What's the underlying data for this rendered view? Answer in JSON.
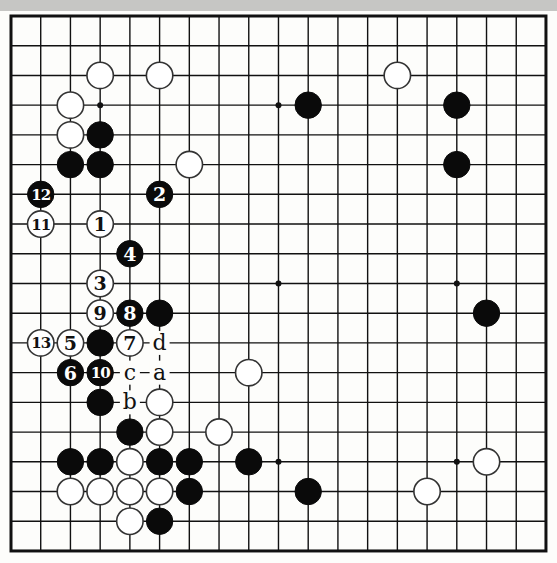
{
  "diagram": {
    "type": "go-board-diagram",
    "board_size": 19,
    "colors": {
      "background": "#fdfdfb",
      "band": "#c6c6c4",
      "line": "#111111",
      "black": "#0a0a0a",
      "white": "#ffffff"
    },
    "star_points": [
      [
        3,
        3
      ],
      [
        9,
        3
      ],
      [
        15,
        3
      ],
      [
        3,
        9
      ],
      [
        9,
        9
      ],
      [
        15,
        9
      ],
      [
        3,
        15
      ],
      [
        9,
        15
      ],
      [
        15,
        15
      ]
    ],
    "stones": [
      {
        "c": "W",
        "x": 3,
        "y": 2
      },
      {
        "c": "W",
        "x": 5,
        "y": 2
      },
      {
        "c": "W",
        "x": 13,
        "y": 2
      },
      {
        "c": "W",
        "x": 2,
        "y": 3
      },
      {
        "c": "B",
        "x": 10,
        "y": 3
      },
      {
        "c": "B",
        "x": 15,
        "y": 3
      },
      {
        "c": "W",
        "x": 2,
        "y": 4
      },
      {
        "c": "B",
        "x": 3,
        "y": 4
      },
      {
        "c": "B",
        "x": 2,
        "y": 5
      },
      {
        "c": "B",
        "x": 3,
        "y": 5
      },
      {
        "c": "W",
        "x": 6,
        "y": 5
      },
      {
        "c": "B",
        "x": 15,
        "y": 5
      },
      {
        "c": "B",
        "x": 1,
        "y": 6,
        "n": "12"
      },
      {
        "c": "B",
        "x": 5,
        "y": 6,
        "n": "2"
      },
      {
        "c": "W",
        "x": 1,
        "y": 7,
        "n": "11"
      },
      {
        "c": "W",
        "x": 3,
        "y": 7,
        "n": "1"
      },
      {
        "c": "B",
        "x": 4,
        "y": 8,
        "n": "4"
      },
      {
        "c": "W",
        "x": 3,
        "y": 9,
        "n": "3"
      },
      {
        "c": "W",
        "x": 3,
        "y": 10,
        "n": "9"
      },
      {
        "c": "B",
        "x": 4,
        "y": 10,
        "n": "8"
      },
      {
        "c": "B",
        "x": 5,
        "y": 10
      },
      {
        "c": "B",
        "x": 16,
        "y": 10
      },
      {
        "c": "W",
        "x": 1,
        "y": 11,
        "n": "13"
      },
      {
        "c": "W",
        "x": 2,
        "y": 11,
        "n": "5"
      },
      {
        "c": "B",
        "x": 3,
        "y": 11
      },
      {
        "c": "W",
        "x": 4,
        "y": 11,
        "n": "7"
      },
      {
        "c": "B",
        "x": 2,
        "y": 12,
        "n": "6"
      },
      {
        "c": "B",
        "x": 3,
        "y": 12,
        "n": "10"
      },
      {
        "c": "W",
        "x": 8,
        "y": 12
      },
      {
        "c": "B",
        "x": 3,
        "y": 13
      },
      {
        "c": "W",
        "x": 5,
        "y": 13
      },
      {
        "c": "B",
        "x": 4,
        "y": 14
      },
      {
        "c": "W",
        "x": 5,
        "y": 14
      },
      {
        "c": "W",
        "x": 7,
        "y": 14
      },
      {
        "c": "B",
        "x": 2,
        "y": 15
      },
      {
        "c": "B",
        "x": 3,
        "y": 15
      },
      {
        "c": "W",
        "x": 4,
        "y": 15
      },
      {
        "c": "B",
        "x": 5,
        "y": 15
      },
      {
        "c": "B",
        "x": 6,
        "y": 15
      },
      {
        "c": "B",
        "x": 8,
        "y": 15
      },
      {
        "c": "W",
        "x": 16,
        "y": 15
      },
      {
        "c": "W",
        "x": 2,
        "y": 16
      },
      {
        "c": "W",
        "x": 3,
        "y": 16
      },
      {
        "c": "W",
        "x": 4,
        "y": 16
      },
      {
        "c": "W",
        "x": 5,
        "y": 16
      },
      {
        "c": "B",
        "x": 6,
        "y": 16
      },
      {
        "c": "B",
        "x": 10,
        "y": 16
      },
      {
        "c": "W",
        "x": 14,
        "y": 16
      },
      {
        "c": "W",
        "x": 4,
        "y": 17
      },
      {
        "c": "B",
        "x": 5,
        "y": 17
      }
    ],
    "labels": [
      {
        "t": "d",
        "x": 5,
        "y": 11
      },
      {
        "t": "c",
        "x": 4,
        "y": 12
      },
      {
        "t": "a",
        "x": 5,
        "y": 12
      },
      {
        "t": "b",
        "x": 4,
        "y": 13
      }
    ]
  }
}
